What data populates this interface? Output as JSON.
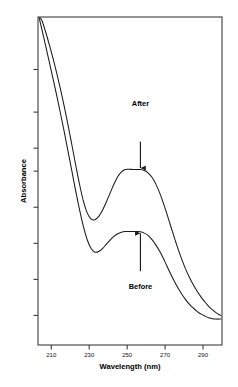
{
  "figure": {
    "background_color": "#ffffff",
    "line_color": "#1a1a1a",
    "axis_color": "#3c3c3c",
    "top_cut_text": "",
    "plot_frame": {
      "left": 38,
      "top": 17,
      "right": 222,
      "bottom": 345
    }
  },
  "labels": {
    "xlabel": "Wavelength (nm)",
    "ylabel": "Absorbance",
    "after": "After",
    "before": "Before"
  },
  "chart_data": {
    "type": "line",
    "title": "",
    "subtitle": "",
    "xlabel": "Wavelength (nm)",
    "ylabel": "Absorbance",
    "xlim": [
      203,
      300
    ],
    "ylim": [
      0,
      1
    ],
    "xticks": [
      210,
      230,
      250,
      270,
      290
    ],
    "xticklabels": [
      "210",
      "230",
      "250",
      "270",
      "290"
    ],
    "yticks": [
      0.09,
      0.2,
      0.31,
      0.42,
      0.53,
      0.6,
      0.71,
      0.84
    ],
    "yticklabels": [
      "",
      "",
      "",
      "",
      "",
      "",
      "",
      ""
    ],
    "grid": false,
    "legend": false,
    "legend_position": "none",
    "annotations": [
      {
        "text": "After",
        "x": 257,
        "y": 0.62,
        "arrow": "down",
        "target_x": 257,
        "target_y": 0.535,
        "label_x": 257,
        "label_y": 0.735
      },
      {
        "text": "Before",
        "x": 257,
        "y": 0.225,
        "arrow": "up",
        "target_x": 257,
        "target_y": 0.345,
        "label_x": 257,
        "label_y": 0.178
      }
    ],
    "series": [
      {
        "name": "After",
        "x": [
          203.5,
          205,
          207,
          209,
          211,
          213,
          215,
          217,
          219,
          221,
          223,
          225,
          227,
          229,
          231,
          233,
          235,
          237,
          239,
          241,
          243,
          245,
          247,
          249,
          251,
          253,
          255,
          257,
          259,
          261,
          263,
          265,
          267,
          269,
          271,
          273,
          275,
          277,
          279,
          281,
          283,
          285,
          287,
          289,
          291,
          293,
          295,
          297,
          299,
          300
        ],
        "y": [
          1.0,
          0.99,
          0.955,
          0.915,
          0.872,
          0.826,
          0.776,
          0.723,
          0.666,
          0.606,
          0.545,
          0.487,
          0.437,
          0.402,
          0.384,
          0.382,
          0.392,
          0.411,
          0.436,
          0.463,
          0.49,
          0.513,
          0.528,
          0.535,
          0.536,
          0.535,
          0.535,
          0.535,
          0.532,
          0.525,
          0.512,
          0.492,
          0.466,
          0.434,
          0.399,
          0.362,
          0.325,
          0.29,
          0.258,
          0.229,
          0.204,
          0.182,
          0.163,
          0.146,
          0.131,
          0.118,
          0.107,
          0.098,
          0.091,
          0.088
        ]
      },
      {
        "name": "Before",
        "x": [
          203.5,
          205,
          207,
          209,
          211,
          213,
          215,
          217,
          219,
          221,
          223,
          225,
          227,
          229,
          231,
          233,
          235,
          237,
          239,
          241,
          243,
          245,
          247,
          249,
          251,
          253,
          255,
          257,
          259,
          261,
          263,
          265,
          267,
          269,
          271,
          273,
          275,
          277,
          279,
          281,
          283,
          285,
          287,
          289,
          291,
          293,
          295,
          297,
          299,
          300
        ],
        "y": [
          1.0,
          0.963,
          0.913,
          0.862,
          0.81,
          0.757,
          0.702,
          0.645,
          0.586,
          0.526,
          0.466,
          0.41,
          0.36,
          0.32,
          0.294,
          0.283,
          0.285,
          0.294,
          0.307,
          0.32,
          0.331,
          0.339,
          0.344,
          0.346,
          0.346,
          0.346,
          0.346,
          0.345,
          0.341,
          0.334,
          0.322,
          0.306,
          0.287,
          0.265,
          0.24,
          0.216,
          0.193,
          0.172,
          0.153,
          0.137,
          0.123,
          0.112,
          0.102,
          0.094,
          0.088,
          0.083,
          0.08,
          0.079,
          0.079,
          0.079
        ]
      }
    ]
  }
}
